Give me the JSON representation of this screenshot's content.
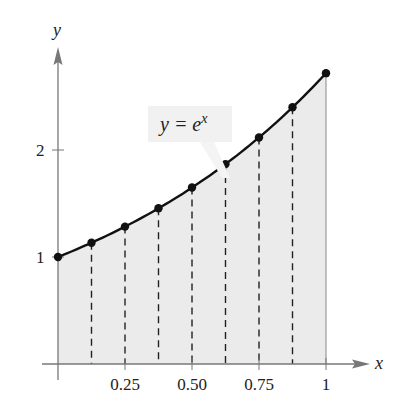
{
  "chart_data": {
    "type": "area",
    "title": "",
    "function_label_parts": {
      "lhs": "y = e",
      "exp": "x"
    },
    "xlabel": "x",
    "ylabel": "y",
    "xlim": [
      0,
      1
    ],
    "ylim": [
      0,
      2.8
    ],
    "xticks": [
      0.25,
      0.5,
      0.75,
      1
    ],
    "xtick_labels": [
      "0.25",
      "0.50",
      "0.75",
      "1"
    ],
    "yticks": [
      1,
      2
    ],
    "ytick_labels": [
      "1",
      "2"
    ],
    "x": [
      0,
      0.125,
      0.25,
      0.375,
      0.5,
      0.625,
      0.75,
      0.875,
      1
    ],
    "values": [
      1.0,
      1.133,
      1.284,
      1.455,
      1.649,
      1.868,
      2.117,
      2.399,
      2.718
    ],
    "partition_lines": [
      0.125,
      0.25,
      0.375,
      0.5,
      0.625,
      0.75,
      0.875
    ],
    "fill_color": "#ebebeb",
    "curve_color": "#111111",
    "axis_color": "#777777",
    "grid": false,
    "legend": null
  },
  "labels": {
    "y_axis": "y",
    "x_axis": "x",
    "eq_lhs": "y = e",
    "eq_exp": "x",
    "yt1": "1",
    "yt2": "2",
    "xt1": "0.25",
    "xt2": "0.50",
    "xt3": "0.75",
    "xt4": "1"
  }
}
